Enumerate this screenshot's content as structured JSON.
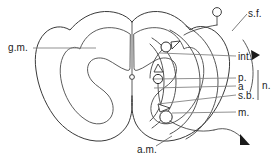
{
  "figure": {
    "background_color": "#ffffff",
    "ink_color": "#2f2f2f",
    "leader_color": "#7d7d7d",
    "width": 277,
    "height": 164
  },
  "labels": {
    "gray_matter": "g.m.",
    "sensory_fiber": "s.f.",
    "internuncial": "int.",
    "posterior": "p.",
    "anterior": "a",
    "sensory_branch": "s.b.",
    "nerve": "n.",
    "motor": "m.",
    "anterior_motor": "a.m."
  },
  "structures": {
    "central_canal": "central-canal",
    "dorsal_root_ganglion": "dorsal-root-ganglion-cell",
    "neurons": [
      {
        "name": "internuncial-neuron",
        "cx": 166,
        "cy": 47,
        "r": 5.0
      },
      {
        "name": "posterior-horn-neuron",
        "cx": 158,
        "cy": 79,
        "r": 4.6
      },
      {
        "name": "anterior-motor-neuron",
        "cx": 166,
        "cy": 117,
        "r": 6.2
      }
    ],
    "ganglion": {
      "cx": 217,
      "cy": 12,
      "r": 4.4
    },
    "canal": {
      "cx": 132,
      "cy": 77,
      "r": 2.4
    }
  },
  "bracket": {
    "name": "nerve-group-bracket",
    "x": 258,
    "y_top": 70,
    "y_bottom": 100
  }
}
